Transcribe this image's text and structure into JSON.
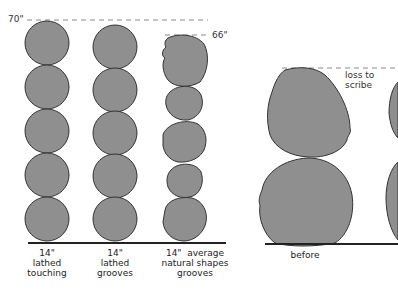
{
  "diagram": {
    "left_panel": {
      "height_marker_1": "70\"",
      "height_marker_2": "66\"",
      "columns": [
        {
          "id": "lathed-touching",
          "label": "14\"\nlathed\ntouching",
          "log_count": 5
        },
        {
          "id": "lathed-grooves",
          "label": "14\"\nlathed\ngrooves",
          "log_count": 5
        },
        {
          "id": "natural-grooves",
          "label": "14\"  average\nnatural shapes\ngrooves",
          "log_count": 5
        }
      ]
    },
    "right_panel": {
      "annotation": "loss to scribe",
      "labels": [
        "before"
      ],
      "log_count": 2
    },
    "colors": {
      "log_fill": "#8f8f8f",
      "log_stroke": "#333333",
      "ground": "#222222",
      "dash": "#888888"
    }
  }
}
